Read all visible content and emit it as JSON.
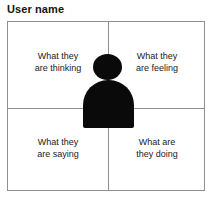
{
  "diagram": {
    "type": "empathy-map",
    "title": "User name",
    "quadrants": [
      {
        "id": "thinking",
        "position": "top-left",
        "label": "What they\nare thinking"
      },
      {
        "id": "feeling",
        "position": "top-right",
        "label": "What they\nare feeling"
      },
      {
        "id": "saying",
        "position": "bottom-left",
        "label": "What they\nare saying"
      },
      {
        "id": "doing",
        "position": "bottom-right",
        "label": "What are\nthey doing"
      }
    ],
    "center_figure": {
      "icon": "person-silhouette-icon",
      "color": "#0a0a0a"
    },
    "colors": {
      "border": "#8f8f8f",
      "text": "#1a1a1a",
      "title": "#141414",
      "background": "#ffffff",
      "figure": "#0a0a0a"
    }
  }
}
